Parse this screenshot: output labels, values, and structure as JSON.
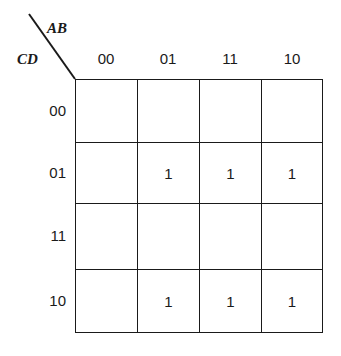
{
  "kmap": {
    "row_variables": "CD",
    "col_variables": "AB",
    "col_labels": [
      "00",
      "01",
      "11",
      "10"
    ],
    "row_labels": [
      "00",
      "01",
      "11",
      "10"
    ],
    "cells": [
      [
        "",
        "",
        "",
        ""
      ],
      [
        "",
        "1",
        "1",
        "1"
      ],
      [
        "",
        "",
        "",
        ""
      ],
      [
        "",
        "1",
        "1",
        "1"
      ]
    ]
  }
}
